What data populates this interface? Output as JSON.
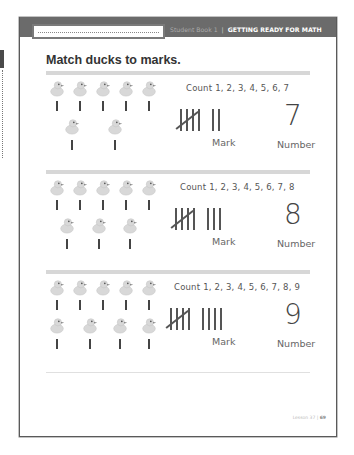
{
  "header": {
    "name_line_placeholder": "",
    "book": "Student Book 1",
    "separator": "|",
    "section": "GETTING READY FOR MATH"
  },
  "activity": {
    "title": "Match ducks to marks."
  },
  "rows": [
    {
      "count_text": "Count 1, 2, 3, 4, 5, 6, 7",
      "ducks_top": 5,
      "ducks_bottom": 2,
      "tally_groups_of_five": 1,
      "tally_extra": 2,
      "number": "7",
      "mark_label": "Mark",
      "number_label": "Number"
    },
    {
      "count_text": "Count 1, 2, 3, 4, 5, 6, 7, 8",
      "ducks_top": 5,
      "ducks_bottom": 3,
      "tally_groups_of_five": 1,
      "tally_extra": 3,
      "number": "8",
      "mark_label": "Mark",
      "number_label": "Number"
    },
    {
      "count_text": "Count 1, 2, 3, 4, 5, 6, 7, 8, 9",
      "ducks_top": 5,
      "ducks_bottom": 4,
      "tally_groups_of_five": 1,
      "tally_extra": 4,
      "number": "9",
      "mark_label": "Mark",
      "number_label": "Number"
    }
  ],
  "icons": {
    "duck": "rubber-duck-icon",
    "tally": "tally-mark-icon"
  },
  "colors": {
    "header_bar": "#6b6b6b",
    "rule": "#d7d7d7",
    "duck_body": "#d8d8d8",
    "text": "#333333"
  },
  "footer": {
    "lesson": "Lesson 37",
    "separator": "|",
    "page": "69"
  }
}
